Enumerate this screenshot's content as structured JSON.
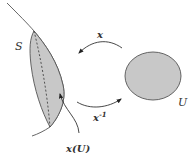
{
  "diagram": {
    "labels": {
      "surface": "S",
      "domain": "U",
      "map": "x",
      "inverse_map": "x",
      "inverse_exp": "-1",
      "image": "x(U)"
    },
    "colors": {
      "fill": "#c8c8c8",
      "stroke": "#555555"
    }
  }
}
